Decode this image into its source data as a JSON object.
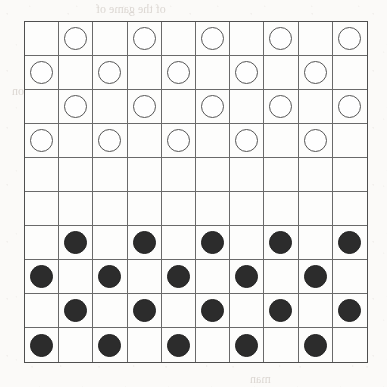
{
  "page": {
    "background_color": "#fbfaf8",
    "bleed_text": [
      {
        "text": "of the game of",
        "x": 96,
        "y": 2,
        "size": 12
      },
      {
        "text": "position",
        "x": 12,
        "y": 84,
        "size": 12
      },
      {
        "text": "in the",
        "x": 138,
        "y": 86,
        "size": 12
      },
      {
        "text": "of the",
        "x": 210,
        "y": 120,
        "size": 12
      },
      {
        "text": "starting",
        "x": 130,
        "y": 160,
        "size": 13
      },
      {
        "text": "of the squares",
        "x": 40,
        "y": 196,
        "size": 13
      },
      {
        "text": "the",
        "x": 180,
        "y": 236,
        "size": 13
      },
      {
        "text": "of the",
        "x": 268,
        "y": 238,
        "size": 13
      },
      {
        "text": "is made",
        "x": 56,
        "y": 272,
        "size": 13
      },
      {
        "text": "a game",
        "x": 150,
        "y": 306,
        "size": 13
      },
      {
        "text": "the",
        "x": 286,
        "y": 308,
        "size": 13
      },
      {
        "text": "the rules",
        "x": 210,
        "y": 344,
        "size": 13
      },
      {
        "text": "man",
        "x": 250,
        "y": 372,
        "size": 12
      }
    ]
  },
  "board": {
    "name": "draughts-board",
    "rows": 10,
    "columns": 10,
    "cell_size_px": 34,
    "grid_line_color": "#6a6a6a",
    "border_color": "#4f4f4f",
    "square_color": "#fdfdfc",
    "white_piece_color": "#fefefe",
    "white_piece_border_color": "#555555",
    "black_piece_color": "#2c2c2c",
    "piece_counts": {
      "white": 20,
      "black": 20,
      "empty": 60
    },
    "legend": {
      "empty": "",
      "white": "white-piece",
      "black": "black-piece"
    },
    "cells": [
      [
        "",
        "white",
        "",
        "white",
        "",
        "white",
        "",
        "white",
        "",
        "white"
      ],
      [
        "white",
        "",
        "white",
        "",
        "white",
        "",
        "white",
        "",
        "white",
        ""
      ],
      [
        "",
        "white",
        "",
        "white",
        "",
        "white",
        "",
        "white",
        "",
        "white"
      ],
      [
        "white",
        "",
        "white",
        "",
        "white",
        "",
        "white",
        "",
        "white",
        ""
      ],
      [
        "",
        "",
        "",
        "",
        "",
        "",
        "",
        "",
        "",
        ""
      ],
      [
        "",
        "",
        "",
        "",
        "",
        "",
        "",
        "",
        "",
        ""
      ],
      [
        "",
        "black",
        "",
        "black",
        "",
        "black",
        "",
        "black",
        "",
        "black"
      ],
      [
        "black",
        "",
        "black",
        "",
        "black",
        "",
        "black",
        "",
        "black",
        ""
      ],
      [
        "",
        "black",
        "",
        "black",
        "",
        "black",
        "",
        "black",
        "",
        "black"
      ],
      [
        "black",
        "",
        "black",
        "",
        "black",
        "",
        "black",
        "",
        "black",
        ""
      ]
    ]
  }
}
